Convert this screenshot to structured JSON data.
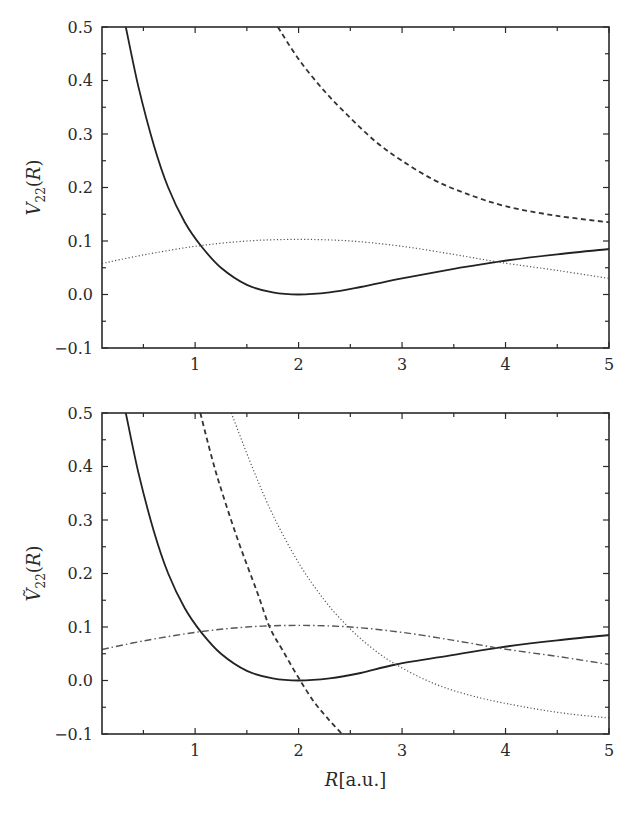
{
  "chart_data": [
    {
      "type": "line",
      "title": "",
      "xlabel": "",
      "ylabel": "V22(R)",
      "ylabel_parts": {
        "base": "V",
        "sub": "22",
        "arg": "(R)",
        "tilde": false
      },
      "xlim": [
        0.1,
        5
      ],
      "ylim": [
        -0.1,
        0.5
      ],
      "xticks": [
        1,
        2,
        3,
        4,
        5
      ],
      "xtick_labels": [
        "1",
        "2",
        "3",
        "4",
        "5"
      ],
      "yticks": [
        -0.1,
        0.0,
        0.1,
        0.2,
        0.3,
        0.4,
        0.5
      ],
      "ytick_labels": [
        "−0.1",
        "0.0",
        "0.1",
        "0.2",
        "0.3",
        "0.4",
        "0.5"
      ],
      "grid": false,
      "legend": null,
      "series": [
        {
          "name": "solid",
          "style": "solid",
          "x": [
            0.33,
            0.45,
            0.6,
            0.74,
            0.9,
            1.06,
            1.25,
            1.5,
            1.75,
            2.0,
            2.3,
            2.6,
            3.0,
            3.5,
            3.95,
            4.5,
            5.0
          ],
          "y": [
            0.5,
            0.39,
            0.28,
            0.2,
            0.135,
            0.09,
            0.05,
            0.018,
            0.004,
            0.0,
            0.004,
            0.014,
            0.03,
            0.048,
            0.062,
            0.075,
            0.085
          ]
        },
        {
          "name": "dashed",
          "style": "dashed",
          "x": [
            1.8,
            2.0,
            2.25,
            2.5,
            2.75,
            3.0,
            3.3,
            3.6,
            4.0,
            4.5,
            5.0
          ],
          "y": [
            0.5,
            0.44,
            0.38,
            0.33,
            0.285,
            0.25,
            0.215,
            0.19,
            0.165,
            0.147,
            0.135
          ]
        },
        {
          "name": "dotted",
          "style": "dotted",
          "x": [
            0.1,
            0.5,
            1.0,
            1.5,
            2.0,
            2.5,
            3.0,
            3.5,
            3.95,
            4.5,
            5.0
          ],
          "y": [
            0.058,
            0.074,
            0.09,
            0.1,
            0.103,
            0.1,
            0.09,
            0.075,
            0.06,
            0.045,
            0.03
          ]
        }
      ]
    },
    {
      "type": "line",
      "title": "",
      "xlabel": "R[a.u.]",
      "xlabel_parts": {
        "var": "R",
        "unit": "[a.u.]"
      },
      "ylabel": "Ṽ22(R)",
      "ylabel_parts": {
        "base": "V",
        "sub": "22",
        "arg": "(R)",
        "tilde": true
      },
      "xlim": [
        0.1,
        5
      ],
      "ylim": [
        -0.1,
        0.5
      ],
      "xticks": [
        1,
        2,
        3,
        4,
        5
      ],
      "xtick_labels": [
        "1",
        "2",
        "3",
        "4",
        "5"
      ],
      "yticks": [
        -0.1,
        0.0,
        0.1,
        0.2,
        0.3,
        0.4,
        0.5
      ],
      "ytick_labels": [
        "−0.1",
        "0.0",
        "0.1",
        "0.2",
        "0.3",
        "0.4",
        "0.5"
      ],
      "grid": false,
      "legend": null,
      "series": [
        {
          "name": "solid",
          "style": "solid",
          "x": [
            0.33,
            0.45,
            0.6,
            0.74,
            0.9,
            1.06,
            1.25,
            1.5,
            1.75,
            2.0,
            2.3,
            2.6,
            2.94,
            3.5,
            3.95,
            4.5,
            5.0
          ],
          "y": [
            0.5,
            0.39,
            0.28,
            0.2,
            0.135,
            0.09,
            0.05,
            0.018,
            0.004,
            0.0,
            0.004,
            0.014,
            0.03,
            0.048,
            0.062,
            0.075,
            0.085
          ]
        },
        {
          "name": "dashed",
          "style": "dashed",
          "x": [
            1.05,
            1.2,
            1.4,
            1.6,
            1.72,
            1.85,
            2.0,
            2.15,
            2.3,
            2.42
          ],
          "y": [
            0.5,
            0.39,
            0.27,
            0.165,
            0.1,
            0.055,
            0.005,
            -0.04,
            -0.075,
            -0.1
          ]
        },
        {
          "name": "dotted",
          "style": "dotted",
          "x": [
            1.35,
            1.55,
            1.75,
            2.0,
            2.25,
            2.48,
            2.7,
            2.94,
            3.3,
            3.7,
            4.2,
            4.6,
            5.0
          ],
          "y": [
            0.5,
            0.4,
            0.31,
            0.22,
            0.15,
            0.1,
            0.062,
            0.03,
            -0.005,
            -0.03,
            -0.05,
            -0.062,
            -0.07
          ]
        },
        {
          "name": "dash-dot",
          "style": "dashdot",
          "x": [
            0.1,
            0.5,
            1.0,
            1.5,
            2.0,
            2.5,
            3.0,
            3.5,
            3.95,
            4.5,
            5.0
          ],
          "y": [
            0.058,
            0.074,
            0.09,
            0.1,
            0.103,
            0.1,
            0.09,
            0.075,
            0.06,
            0.045,
            0.03
          ]
        }
      ]
    }
  ],
  "panels": [
    {
      "box": {
        "left": 102,
        "top": 27,
        "right": 609,
        "bottom": 348
      }
    },
    {
      "box": {
        "left": 102,
        "top": 413,
        "right": 609,
        "bottom": 734
      }
    }
  ]
}
